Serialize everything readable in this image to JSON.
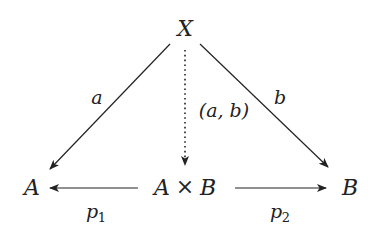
{
  "diagram": {
    "type": "commutative-diagram",
    "colors": {
      "stroke": "#222222",
      "background": "#ffffff"
    },
    "nodes": {
      "X": {
        "label": "X",
        "x": 185,
        "y": 36
      },
      "A": {
        "label": "A",
        "x": 32,
        "y": 195
      },
      "AxB": {
        "label_left": "A",
        "times": "×",
        "label_right": "B",
        "x": 185,
        "y": 195
      },
      "B": {
        "label": "B",
        "x": 350,
        "y": 195
      }
    },
    "edges": {
      "a": {
        "from": "X",
        "to": "A",
        "label": "a",
        "style": "solid"
      },
      "b": {
        "from": "X",
        "to": "B",
        "label": "b",
        "style": "solid"
      },
      "ab": {
        "from": "X",
        "to": "A×B",
        "label": "(a, b)",
        "style": "dotted"
      },
      "p1": {
        "from": "A×B",
        "to": "A",
        "label_base": "p",
        "label_sub": "1",
        "style": "solid"
      },
      "p2": {
        "from": "A×B",
        "to": "B",
        "label_base": "p",
        "label_sub": "2",
        "style": "solid"
      }
    }
  }
}
